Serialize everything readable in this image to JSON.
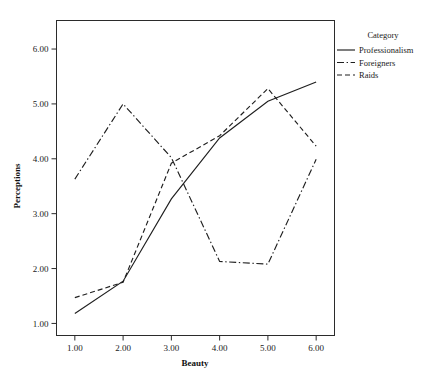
{
  "chart_data": {
    "type": "line",
    "title": "",
    "xlabel": "Beauty",
    "ylabel": "Perceptions",
    "x": [
      1,
      2,
      3,
      4,
      5,
      6
    ],
    "xticklabels": [
      "1.00",
      "2.00",
      "3.00",
      "4.00",
      "5.00",
      "6.00"
    ],
    "yticklabels": [
      "1.00",
      "2.00",
      "3.00",
      "4.00",
      "5.00",
      "6.00"
    ],
    "yticks": [
      1,
      2,
      3,
      4,
      5,
      6
    ],
    "xlim": [
      0.62,
      6.38
    ],
    "ylim": [
      0.78,
      6.52
    ],
    "grid": false,
    "legend_position": "right",
    "legend_title": "Category",
    "series": [
      {
        "name": "Professionalism",
        "style": "solid",
        "values": [
          1.18,
          1.77,
          3.27,
          4.38,
          5.05,
          5.4
        ]
      },
      {
        "name": "Foreigners",
        "style": "dash-dot",
        "values": [
          3.63,
          5.0,
          4.02,
          2.13,
          2.08,
          3.99
        ]
      },
      {
        "name": "Raids",
        "style": "dashed",
        "values": [
          1.47,
          1.75,
          3.92,
          4.42,
          5.28,
          4.23
        ]
      }
    ]
  },
  "legend": {
    "title": "Category",
    "items": [
      {
        "label": "Professionalism",
        "style": "solid"
      },
      {
        "label": "Foreigners",
        "style": "dash-dot"
      },
      {
        "label": "Raids",
        "style": "dashed"
      }
    ]
  },
  "axes": {
    "x_title": "Beauty",
    "y_title": "Perceptions"
  },
  "colors": {
    "line": "#1f1f1f",
    "axis": "#2b2b2b",
    "background": "#ffffff"
  }
}
